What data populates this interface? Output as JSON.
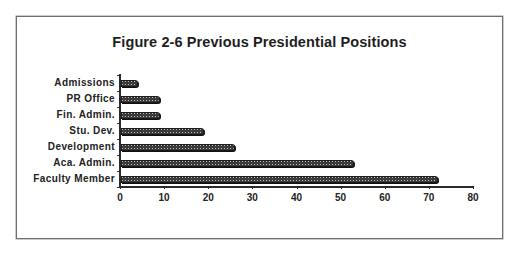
{
  "chart_data": {
    "type": "bar",
    "orientation": "horizontal",
    "title": "Figure 2-6  Previous Presidential Positions",
    "categories": [
      "Admissions",
      "PR Office",
      "Fin. Admin.",
      "Stu. Dev.",
      "Development",
      "Aca. Admin.",
      "Faculty Member"
    ],
    "values": [
      4,
      9,
      9,
      19,
      26,
      53,
      72
    ],
    "xlabel": "",
    "ylabel": "",
    "xlim": [
      0,
      80
    ],
    "xticks": [
      0,
      10,
      20,
      30,
      40,
      50,
      60,
      70,
      80
    ],
    "grid": false,
    "legend": null,
    "bar_fill": "dark hatched / dotted pattern"
  },
  "figure": {
    "title": "Figure 2-6  Previous Presidential Positions",
    "xtick_labels": [
      "0",
      "10",
      "20",
      "30",
      "40",
      "50",
      "60",
      "70",
      "80"
    ],
    "bars": [
      {
        "label": "Admissions",
        "value": 4
      },
      {
        "label": "PR Office",
        "value": 9
      },
      {
        "label": "Fin. Admin.",
        "value": 9
      },
      {
        "label": "Stu. Dev.",
        "value": 19
      },
      {
        "label": "Development",
        "value": 26
      },
      {
        "label": "Aca. Admin.",
        "value": 53
      },
      {
        "label": "Faculty Member",
        "value": 72
      }
    ]
  },
  "colors": {
    "bar": "#3a3a3a",
    "axis": "#2a2a2a",
    "frame": "#6f6f6f",
    "text": "#222222"
  }
}
